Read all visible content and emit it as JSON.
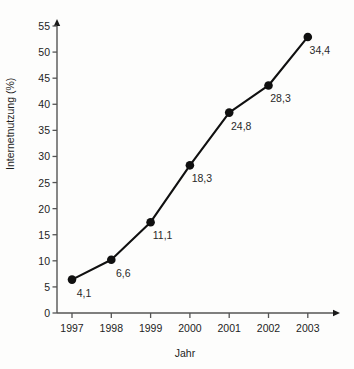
{
  "chart_data": {
    "type": "line",
    "title": "",
    "xlabel": "Jahr",
    "ylabel": "Internetnutzung (%)",
    "categories": [
      "1997",
      "1998",
      "1999",
      "2000",
      "2001",
      "2002",
      "2003"
    ],
    "values": [
      6.4,
      10.2,
      17.4,
      28.3,
      38.4,
      43.6,
      52.9
    ],
    "point_labels": [
      "4,1",
      "6,6",
      "11,1",
      "18,3",
      "24,8",
      "28,3",
      "34,4"
    ],
    "ylim": [
      0,
      57
    ],
    "xlim": [
      1996.6,
      2003.9
    ],
    "yticks": [
      "0",
      "5",
      "10",
      "15",
      "20",
      "25",
      "30",
      "35",
      "40",
      "45",
      "50",
      "55"
    ],
    "ytick_values": [
      0,
      5,
      10,
      15,
      20,
      25,
      30,
      35,
      40,
      45,
      50,
      55
    ],
    "grid": false,
    "legend": false,
    "legend_position": "none",
    "series_color": "#101010",
    "marker": "circle",
    "axis_color": "#545454"
  },
  "axes": {
    "y_title": "Internetnutzung (%)",
    "x_title": "Jahr"
  }
}
